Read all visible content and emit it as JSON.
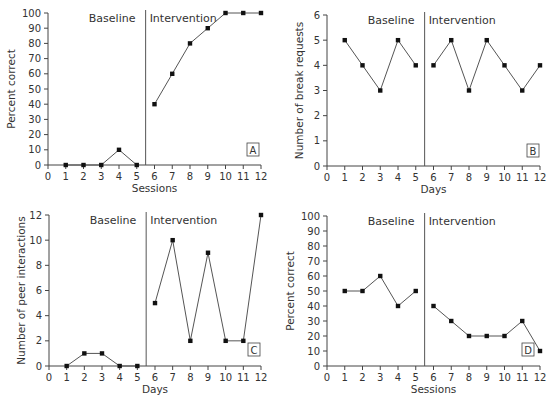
{
  "chart_data": [
    {
      "panel": "A",
      "type": "line",
      "title": "",
      "xlabel": "Sessions",
      "ylabel": "Percent correct",
      "xlim": [
        0,
        12
      ],
      "ylim": [
        0,
        100
      ],
      "x_ticks": [
        0,
        1,
        2,
        3,
        4,
        5,
        6,
        7,
        8,
        9,
        10,
        11,
        12
      ],
      "y_ticks": [
        0,
        10,
        20,
        30,
        40,
        50,
        60,
        70,
        80,
        90,
        100
      ],
      "phase_change_x": 5.5,
      "phases": [
        "Baseline",
        "Intervention"
      ],
      "series": [
        {
          "name": "Baseline",
          "x": [
            1,
            2,
            3,
            4,
            5
          ],
          "values": [
            0,
            0,
            0,
            10,
            0
          ]
        },
        {
          "name": "Intervention",
          "x": [
            6,
            7,
            8,
            9,
            10,
            11,
            12
          ],
          "values": [
            40,
            60,
            80,
            90,
            100,
            100,
            100
          ]
        }
      ],
      "grid": false,
      "legend": null
    },
    {
      "panel": "B",
      "type": "line",
      "title": "",
      "xlabel": "Days",
      "ylabel": "Number of break requests",
      "xlim": [
        0,
        12
      ],
      "ylim": [
        0,
        6
      ],
      "x_ticks": [
        0,
        1,
        2,
        3,
        4,
        5,
        6,
        7,
        8,
        9,
        10,
        11,
        12
      ],
      "y_ticks": [
        0,
        1,
        2,
        3,
        4,
        5,
        6
      ],
      "phase_change_x": 5.5,
      "phases": [
        "Baseline",
        "Intervention"
      ],
      "series": [
        {
          "name": "Baseline",
          "x": [
            1,
            2,
            3,
            4,
            5
          ],
          "values": [
            5,
            4,
            3,
            5,
            4
          ]
        },
        {
          "name": "Intervention",
          "x": [
            6,
            7,
            8,
            9,
            10,
            11,
            12
          ],
          "values": [
            4,
            5,
            3,
            5,
            4,
            3,
            4
          ]
        }
      ],
      "grid": false,
      "legend": null
    },
    {
      "panel": "C",
      "type": "line",
      "title": "",
      "xlabel": "Days",
      "ylabel": "Number of peer interactions",
      "xlim": [
        0,
        12
      ],
      "ylim": [
        0,
        12
      ],
      "x_ticks": [
        0,
        1,
        2,
        3,
        4,
        5,
        6,
        7,
        8,
        9,
        10,
        11,
        12
      ],
      "y_ticks": [
        0,
        2,
        4,
        6,
        8,
        10,
        12
      ],
      "phase_change_x": 5.5,
      "phases": [
        "Baseline",
        "Intervention"
      ],
      "series": [
        {
          "name": "Baseline",
          "x": [
            1,
            2,
            3,
            4,
            5
          ],
          "values": [
            0,
            1,
            1,
            0,
            0
          ]
        },
        {
          "name": "Intervention",
          "x": [
            6,
            7,
            8,
            9,
            10,
            11,
            12
          ],
          "values": [
            5,
            10,
            2,
            9,
            2,
            2,
            12
          ]
        }
      ],
      "grid": false,
      "legend": null
    },
    {
      "panel": "D",
      "type": "line",
      "title": "",
      "xlabel": "Sessions",
      "ylabel": "Percent correct",
      "xlim": [
        0,
        12
      ],
      "ylim": [
        0,
        100
      ],
      "x_ticks": [
        0,
        1,
        2,
        3,
        4,
        5,
        6,
        7,
        8,
        9,
        10,
        11,
        12
      ],
      "y_ticks": [
        0,
        10,
        20,
        30,
        40,
        50,
        60,
        70,
        80,
        90,
        100
      ],
      "phase_change_x": 5.5,
      "phases": [
        "Baseline",
        "Intervention"
      ],
      "series": [
        {
          "name": "Baseline",
          "x": [
            1,
            2,
            3,
            4,
            5
          ],
          "values": [
            50,
            50,
            60,
            40,
            50
          ]
        },
        {
          "name": "Intervention",
          "x": [
            6,
            7,
            8,
            9,
            10,
            11,
            12
          ],
          "values": [
            40,
            30,
            20,
            20,
            20,
            30,
            10
          ]
        }
      ],
      "grid": false,
      "legend": null
    }
  ],
  "layout": [
    {
      "panel": "A",
      "x0px": 48,
      "x12px": 261,
      "y0px": 165,
      "ytopPx": 13,
      "letterBox": [
        247,
        150
      ]
    },
    {
      "panel": "B",
      "x0px": 327,
      "x12px": 540,
      "y0px": 166,
      "ytopPx": 15,
      "letterBox": [
        527,
        151
      ]
    },
    {
      "panel": "C",
      "x0px": 49,
      "x12px": 261,
      "y0px": 366,
      "ytopPx": 215,
      "letterBox": [
        248,
        350
      ]
    },
    {
      "panel": "D",
      "x0px": 327,
      "x12px": 540,
      "y0px": 366,
      "ytopPx": 216,
      "letterBox": [
        522,
        350
      ]
    }
  ],
  "colors": {
    "axis": "#444444",
    "line": "#555555",
    "point": "#111111",
    "text": "#333333"
  }
}
